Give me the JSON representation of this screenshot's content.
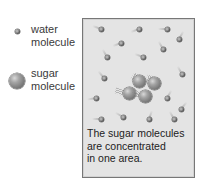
{
  "legend": {
    "items": [
      {
        "icon": "water-molecule-icon",
        "label": "water\nmolecule"
      },
      {
        "icon": "sugar-molecule-icon",
        "label": "sugar\nmolecule"
      }
    ]
  },
  "container": {
    "background": "#e4e4e4",
    "border": "#777777",
    "caption": "The sugar molecules\nare concentrated\nin one area.",
    "water_molecules": [
      {
        "x": 18,
        "y": 10,
        "angle": 200
      },
      {
        "x": 56,
        "y": 10,
        "angle": 160
      },
      {
        "x": 84,
        "y": 10,
        "angle": 180
      },
      {
        "x": 96,
        "y": 20,
        "angle": 300
      },
      {
        "x": 38,
        "y": 24,
        "angle": 160
      },
      {
        "x": 80,
        "y": 30,
        "angle": 240
      },
      {
        "x": 24,
        "y": 38,
        "angle": 240
      },
      {
        "x": 60,
        "y": 38,
        "angle": 200
      },
      {
        "x": 21,
        "y": 59,
        "angle": 230
      },
      {
        "x": 99,
        "y": 55,
        "angle": 240
      },
      {
        "x": 13,
        "y": 79,
        "angle": 170
      },
      {
        "x": 84,
        "y": 79,
        "angle": 300
      },
      {
        "x": 98,
        "y": 90,
        "angle": 310
      },
      {
        "x": 18,
        "y": 100,
        "angle": 180
      },
      {
        "x": 40,
        "y": 98,
        "angle": 210
      },
      {
        "x": 66,
        "y": 100,
        "angle": 290
      },
      {
        "x": 91,
        "y": 100,
        "angle": 240
      }
    ],
    "sugar_molecules": [
      {
        "x": 56,
        "y": 62,
        "angle": 300
      },
      {
        "x": 71,
        "y": 64,
        "angle": 290
      },
      {
        "x": 46,
        "y": 74,
        "angle": 200
      },
      {
        "x": 62,
        "y": 77,
        "angle": 220
      }
    ]
  },
  "colors": {
    "text": "#222222",
    "legend_text": "#3a3a3a",
    "molecule_dark": "#3b3b3b",
    "sugar_gray": "#8a8a8a"
  }
}
